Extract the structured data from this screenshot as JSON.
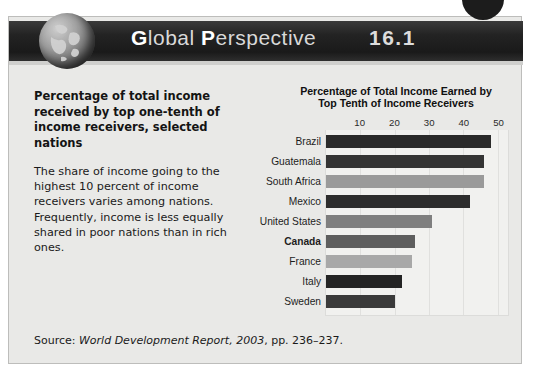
{
  "header": {
    "title_word1_cap": "G",
    "title_word1_rest": "lobal",
    "title_word2_cap": "P",
    "title_word2_rest": "erspective",
    "number": "16.1",
    "globe_icon": "globe-icon"
  },
  "left_column": {
    "lead": "Percentage of total income received by top one-tenth of income receivers, selected nations",
    "body": "The share of income going to the highest 10 percent of income receivers varies among nations. Frequently, income is less equally shared in poor nations than in rich ones."
  },
  "source": {
    "prefix": "Source: ",
    "italic": "World Development Report, 2003",
    "suffix": ", pp. 236–237."
  },
  "chart_data": {
    "type": "bar",
    "orientation": "horizontal",
    "title": "Percentage of Total Income Earned by Top Tenth of Income Receivers",
    "title_line1": "Percentage of Total Income Earned by",
    "title_line2": "Top Tenth of Income Receivers",
    "xlabel": "",
    "ylabel": "",
    "xlim": [
      0,
      53
    ],
    "ticks": [
      10,
      20,
      30,
      40,
      50
    ],
    "tick_labels": [
      "10",
      "20",
      "30",
      "40",
      "50"
    ],
    "grid": true,
    "legend": "none",
    "categories": [
      "Brazil",
      "Guatemala",
      "South Africa",
      "Mexico",
      "United States",
      "Canada",
      "France",
      "Italy",
      "Sweden"
    ],
    "values": [
      48,
      46,
      46,
      42,
      31,
      26,
      25,
      22,
      20
    ],
    "bar_colors": [
      "#2b2b2b",
      "#343434",
      "#9a9a9a",
      "#2d2d2d",
      "#7f7f7f",
      "#5e5e5e",
      "#a8a8a8",
      "#242424",
      "#3a3a3a"
    ],
    "highlight_category": "Canada"
  },
  "colors": {
    "banner_bg": "#232323",
    "panel_bg": "#e9e9e7",
    "plot_bg": "#f1f1ef",
    "text": "#1a1a1a"
  }
}
